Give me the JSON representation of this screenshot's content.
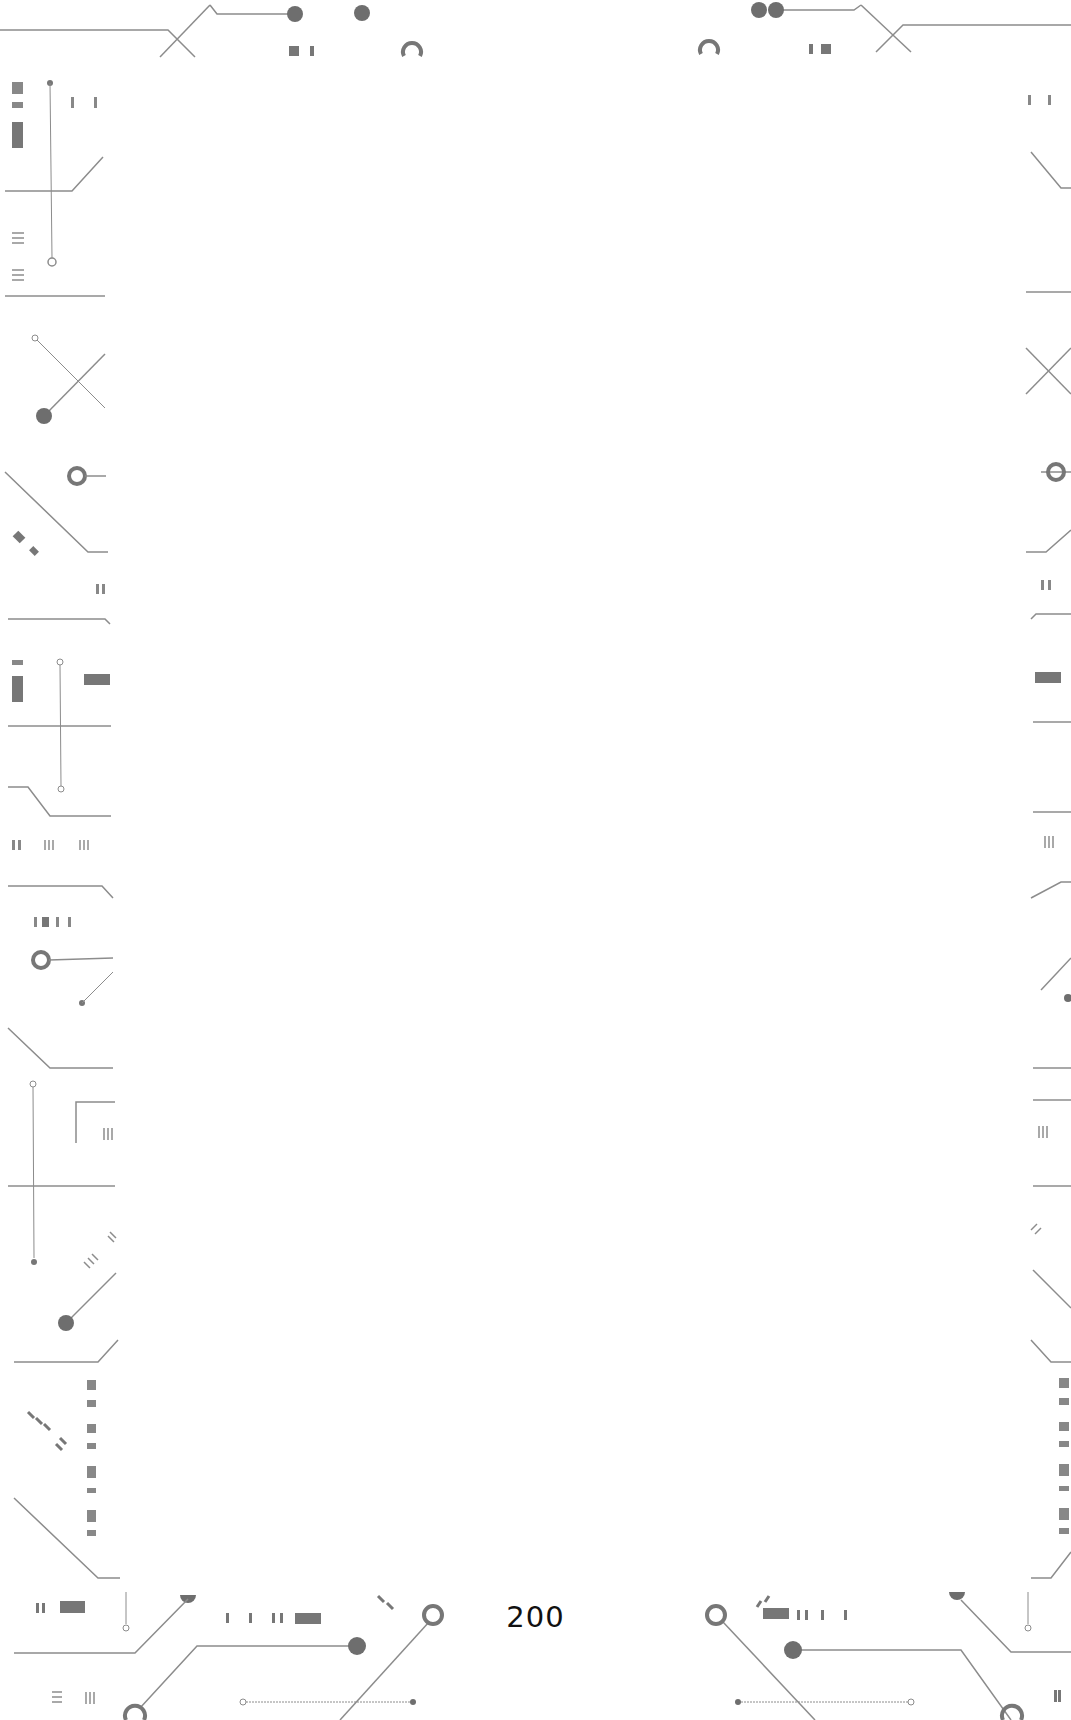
{
  "page": {
    "number": "200",
    "background": "#ffffff",
    "border_style": "circuit-board",
    "border_color": "#8c8c8c",
    "border_fill_color": "#6e6e6e"
  }
}
